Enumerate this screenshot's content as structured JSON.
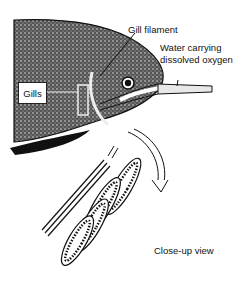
{
  "diagram": {
    "labels": {
      "gill_filament": "Gill filament",
      "water": "Water carrying dissolved oxygen",
      "water_line1": "Water carrying",
      "water_line2": "dissolved oxygen",
      "gills": "Gills",
      "closeup": "Close-up view"
    }
  }
}
